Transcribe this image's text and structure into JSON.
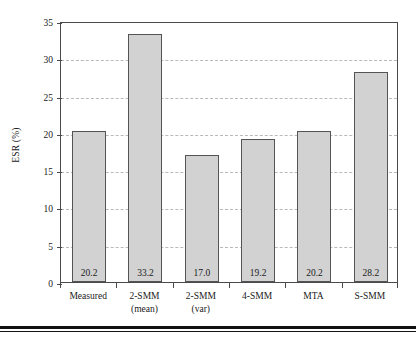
{
  "chart_data": {
    "type": "bar",
    "title": "",
    "xlabel": "",
    "ylabel": "ESR (%)",
    "ylim": [
      0,
      35
    ],
    "yticks": [
      0,
      5,
      10,
      15,
      20,
      25,
      30,
      35
    ],
    "ytick_labels": [
      "0",
      "5",
      "10",
      "15",
      "20",
      "25",
      "30",
      "35"
    ],
    "grid": "horizontal-dashed",
    "legend": "none",
    "categories": [
      "Measured",
      "2-SMM (mean)",
      "2-SMM (var)",
      "4-SMM",
      "MTA",
      "S-SMM"
    ],
    "category_lines": [
      [
        "Measured",
        ""
      ],
      [
        "2-SMM",
        "(mean)"
      ],
      [
        "2-SMM",
        "(var)"
      ],
      [
        "4-SMM",
        ""
      ],
      [
        "MTA",
        ""
      ],
      [
        "S-SMM",
        ""
      ]
    ],
    "values": [
      20.2,
      33.2,
      17.0,
      19.2,
      20.2,
      28.2
    ],
    "value_labels": [
      "20.2",
      "33.2",
      "17.0",
      "19.2",
      "20.2",
      "28.2"
    ],
    "bar_fill_color": "#d2d2d2",
    "bar_edge_color": "#545454",
    "gridline_color": "#b9b9b9",
    "axis_color": "#4a4a4a",
    "text_color": "#1a1a1a",
    "background_color": "#ffffff"
  }
}
